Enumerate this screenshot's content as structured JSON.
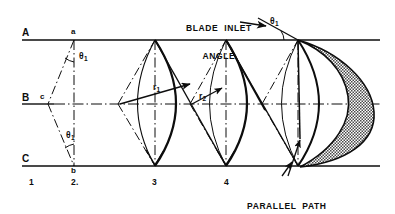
{
  "figure": {
    "type": "engineering-construction-diagram",
    "colors": {
      "line": "#0d0d0d",
      "background": "#ffffff",
      "hatch_fill": "#6e6e6e"
    }
  },
  "reference_lines": [
    {
      "name": "A",
      "label": "A",
      "y": 40
    },
    {
      "name": "B",
      "label": "B",
      "y": 104
    },
    {
      "name": "C",
      "label": "C",
      "y": 166
    }
  ],
  "station_labels": [
    {
      "label": "1",
      "x": 30,
      "y": 182
    },
    {
      "label": "2.",
      "x": 75,
      "y": 182
    },
    {
      "label": "3",
      "x": 153,
      "y": 182
    },
    {
      "label": "4",
      "x": 226,
      "y": 182
    }
  ],
  "point_labels": [
    {
      "label": "a",
      "x": 74,
      "y": 30,
      "note": "apex on line A"
    },
    {
      "label": "c",
      "x": 42,
      "y": 96,
      "note": "left vertex on line B"
    },
    {
      "label": "b",
      "x": 74,
      "y": 170,
      "note": "foot on line C"
    }
  ],
  "angle_labels": [
    {
      "label": "θ",
      "sub": "1",
      "x": 80,
      "y": 57,
      "note": "upper theta-1 at apex a"
    },
    {
      "label": "θ",
      "sub": "1",
      "x": 70,
      "y": 136,
      "note": "lower theta-1 at foot b"
    },
    {
      "label": "θ",
      "sub": "1",
      "x": 272,
      "y": 22,
      "note": "blade inlet angle theta-1 at line A"
    }
  ],
  "radius_labels": [
    {
      "label": "r",
      "sub": "1",
      "x": 155,
      "y": 88,
      "note": "radius r1 of first arc"
    },
    {
      "label": "r",
      "sub": "2",
      "x": 201,
      "y": 97,
      "note": "radius r2 of second arc"
    }
  ],
  "annotations": [
    {
      "name": "blade-inlet-angle",
      "lines": [
        "BLADE  INLET",
        "ANGLE"
      ],
      "x": 190,
      "y": 8,
      "leader_to": [
        272,
        27
      ]
    },
    {
      "name": "parallel-path-through-blading",
      "lines": [
        "PARALLEL  PATH",
        "THROUGH BLADING"
      ],
      "x": 247,
      "y": 186,
      "leader_to": [
        [
          300,
          139
        ],
        [
          290,
          168
        ]
      ]
    }
  ],
  "geometry": {
    "verticals_x": [
      74,
      155,
      226,
      298
    ],
    "arc_apex_top_y": 40,
    "arc_apex_bottom_y": 166,
    "centerline_y": 104,
    "shaded_blade": {
      "present": true,
      "fill": "hatch",
      "leading_x": 298,
      "trailing_x": 375
    }
  }
}
